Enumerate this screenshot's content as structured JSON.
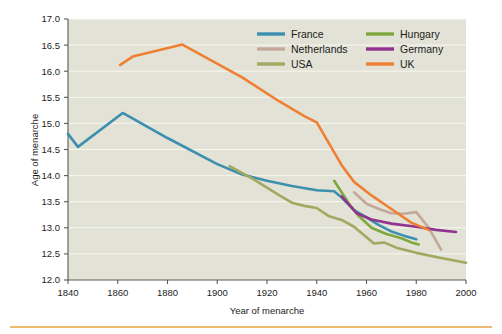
{
  "chart_data": {
    "type": "line",
    "title": "",
    "xlabel": "Year of menarche",
    "ylabel": "Age of menarche",
    "xlim": [
      1840,
      2000
    ],
    "ylim": [
      12.0,
      17.0
    ],
    "xticks": [
      1840,
      1860,
      1880,
      1900,
      1920,
      1940,
      1960,
      1980,
      2000
    ],
    "yticks": [
      12.0,
      12.5,
      13.0,
      13.5,
      14.0,
      14.5,
      15.0,
      15.5,
      16.0,
      16.5,
      17.0
    ],
    "ytick_labels": [
      "12.0",
      "12.5",
      "13.0",
      "13.5",
      "14.0",
      "14.5",
      "15.0",
      "15.5",
      "16.0",
      "16.5",
      "17.0"
    ],
    "xtick_labels": [
      "1840",
      "1860",
      "1880",
      "1900",
      "1920",
      "1940",
      "1960",
      "1980",
      "2000"
    ],
    "grid": "horizontal",
    "legend_position": "top-right",
    "plot_background": "#e2e3d6",
    "figure_background": "#ffffff",
    "series": [
      {
        "name": "France",
        "color": "#3d8fb0",
        "points": [
          [
            1840,
            14.8
          ],
          [
            1844,
            14.55
          ],
          [
            1862,
            15.2
          ],
          [
            1880,
            14.72
          ],
          [
            1900,
            14.22
          ],
          [
            1910,
            14.02
          ],
          [
            1920,
            13.9
          ],
          [
            1930,
            13.8
          ],
          [
            1940,
            13.72
          ],
          [
            1947,
            13.7
          ],
          [
            1950,
            13.58
          ],
          [
            1955,
            13.34
          ],
          [
            1960,
            13.2
          ],
          [
            1965,
            13.05
          ],
          [
            1970,
            12.93
          ],
          [
            1975,
            12.85
          ],
          [
            1980,
            12.78
          ]
        ]
      },
      {
        "name": "Netherlands",
        "color": "#c4a898",
        "points": [
          [
            1955,
            13.68
          ],
          [
            1960,
            13.46
          ],
          [
            1965,
            13.36
          ],
          [
            1970,
            13.28
          ],
          [
            1975,
            13.27
          ],
          [
            1980,
            13.3
          ],
          [
            1985,
            13.0
          ],
          [
            1990,
            12.58
          ]
        ]
      },
      {
        "name": "USA",
        "color": "#a3a860",
        "points": [
          [
            1905,
            14.18
          ],
          [
            1915,
            13.92
          ],
          [
            1925,
            13.62
          ],
          [
            1930,
            13.48
          ],
          [
            1935,
            13.42
          ],
          [
            1940,
            13.38
          ],
          [
            1945,
            13.22
          ],
          [
            1950,
            13.15
          ],
          [
            1955,
            13.02
          ],
          [
            1960,
            12.82
          ],
          [
            1963,
            12.7
          ],
          [
            1967,
            12.72
          ],
          [
            1972,
            12.62
          ],
          [
            1980,
            12.52
          ],
          [
            1990,
            12.42
          ],
          [
            2000,
            12.33
          ]
        ]
      },
      {
        "name": "Hungary",
        "color": "#7fa83c",
        "points": [
          [
            1947,
            13.9
          ],
          [
            1953,
            13.46
          ],
          [
            1957,
            13.22
          ],
          [
            1962,
            13.0
          ],
          [
            1968,
            12.88
          ],
          [
            1974,
            12.8
          ],
          [
            1978,
            12.72
          ],
          [
            1981,
            12.68
          ]
        ]
      },
      {
        "name": "Germany",
        "color": "#92338e",
        "points": [
          [
            1950,
            13.6
          ],
          [
            1956,
            13.28
          ],
          [
            1962,
            13.16
          ],
          [
            1970,
            13.08
          ],
          [
            1980,
            13.02
          ],
          [
            1988,
            12.96
          ],
          [
            1996,
            12.92
          ]
        ]
      },
      {
        "name": "UK",
        "color": "#ef8033",
        "points": [
          [
            1861,
            16.12
          ],
          [
            1866,
            16.28
          ],
          [
            1886,
            16.51
          ],
          [
            1910,
            15.88
          ],
          [
            1925,
            15.42
          ],
          [
            1935,
            15.14
          ],
          [
            1940,
            15.02
          ],
          [
            1950,
            14.2
          ],
          [
            1955,
            13.88
          ],
          [
            1962,
            13.62
          ],
          [
            1970,
            13.36
          ],
          [
            1978,
            13.1
          ],
          [
            1985,
            12.96
          ]
        ]
      }
    ]
  },
  "legend": {
    "entries": [
      {
        "label": "France",
        "color": "#3d8fb0"
      },
      {
        "label": "Hungary",
        "color": "#7fa83c"
      },
      {
        "label": "Netherlands",
        "color": "#c4a898"
      },
      {
        "label": "Germany",
        "color": "#92338e"
      },
      {
        "label": "USA",
        "color": "#a3a860"
      },
      {
        "label": "UK",
        "color": "#ef8033"
      }
    ]
  }
}
